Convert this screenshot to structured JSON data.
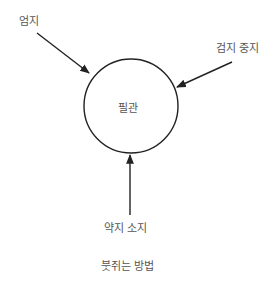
{
  "diagram": {
    "title": "붓쥐는 방법",
    "center_label": "필관",
    "forces": [
      {
        "label": "엄지",
        "direction": "from upper-left toward brush"
      },
      {
        "label": "검지 중지",
        "direction": "from upper-right toward brush"
      },
      {
        "label": "약지 소지",
        "direction": "from below toward brush"
      }
    ],
    "colors": {
      "line": "#222222",
      "text": "#555555",
      "background": "#ffffff"
    }
  }
}
